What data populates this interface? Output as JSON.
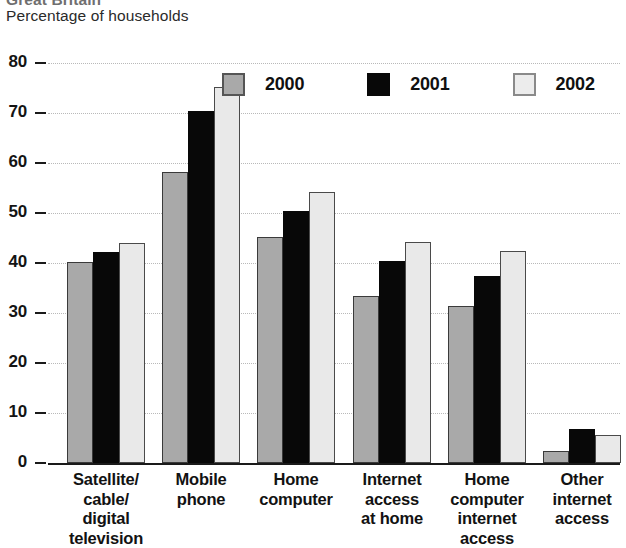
{
  "header": {
    "title_clipped": "Great Britain",
    "subtitle": "Percentage of households"
  },
  "legend": {
    "items": [
      {
        "label": "2000",
        "color": "#a9a9a9",
        "swatch_name": "legend-swatch-2000"
      },
      {
        "label": "2001",
        "color": "#080808",
        "swatch_name": "legend-swatch-2001"
      },
      {
        "label": "2002",
        "color": "#ececec",
        "swatch_name": "legend-swatch-2002"
      }
    ]
  },
  "axis": {
    "y_ticks": [
      "80",
      "70",
      "60",
      "50",
      "40",
      "30",
      "20",
      "10",
      "0"
    ]
  },
  "chart_data": {
    "type": "bar",
    "title": "Great Britain",
    "subtitle": "Percentage of households",
    "xlabel": "",
    "ylabel": "Percentage of households",
    "ylim": [
      0,
      80
    ],
    "ytick_step": 10,
    "grid": true,
    "legend_position": "top-right",
    "categories": [
      "Satellite/ cable/ digital television",
      "Mobile phone",
      "Home computer",
      "Internet access at home",
      "Home computer internet access",
      "Other internet access"
    ],
    "category_lines": [
      [
        "Satellite/",
        "cable/",
        "digital",
        "television"
      ],
      [
        "Mobile",
        "phone"
      ],
      [
        "Home",
        "computer"
      ],
      [
        "Internet",
        "access",
        "at home"
      ],
      [
        "Home",
        "computer",
        "internet",
        "access"
      ],
      [
        "Other",
        "internet",
        "access"
      ]
    ],
    "series": [
      {
        "name": "2000",
        "color": "#a9a9a9",
        "values": [
          40.2,
          58.2,
          45.2,
          33.5,
          31.5,
          2.5
        ]
      },
      {
        "name": "2001",
        "color": "#080808",
        "values": [
          42.2,
          70.5,
          50.5,
          40.5,
          37.5,
          6.8
        ]
      },
      {
        "name": "2002",
        "color": "#ececec",
        "values": [
          44.0,
          75.2,
          54.2,
          44.3,
          42.5,
          5.7
        ]
      }
    ]
  }
}
